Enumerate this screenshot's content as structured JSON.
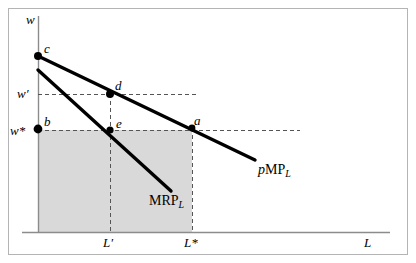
{
  "figure": {
    "type": "economics-diagram",
    "frame": {
      "border_color": "#b4b4b4",
      "background": "#ffffff"
    },
    "axes": {
      "y_axis_label": "w",
      "x_axis_label": "L",
      "axis_color": "#8c8c8c",
      "origin_x": 38,
      "origin_y": 232,
      "x_axis_end": 390,
      "y_axis_top": 16
    },
    "shaded_region": {
      "fill": "#d9d9d9",
      "name": "wage-bill-rectangle",
      "x": 38,
      "y": 130,
      "width": 154,
      "height": 102
    },
    "curves": [
      {
        "name": "pMPL",
        "label_lead": "p",
        "label_main": "MP",
        "label_sub": "L",
        "color": "#000000",
        "stroke_width": 3.4,
        "from": {
          "x": 38,
          "y": 56
        },
        "to": {
          "x": 255,
          "y": 160
        },
        "label_x": 258,
        "label_y": 163
      },
      {
        "name": "MRPL",
        "label_lead": "",
        "label_main": "MRP",
        "label_sub": "L",
        "color": "#000000",
        "stroke_width": 3.4,
        "from": {
          "x": 38,
          "y": 70
        },
        "to": {
          "x": 171,
          "y": 191
        },
        "label_x": 149,
        "label_y": 194
      }
    ],
    "points": [
      {
        "id": "c",
        "label": "c",
        "x": 38,
        "y": 56,
        "label_x": 44,
        "label_y": 42,
        "dot": true
      },
      {
        "id": "d",
        "label": "d",
        "x": 110,
        "y": 94,
        "label_x": 115,
        "label_y": 79,
        "dot": true
      },
      {
        "id": "b",
        "label": "b",
        "x": 38,
        "y": 129,
        "label_x": 44,
        "label_y": 115,
        "dot": true
      },
      {
        "id": "e",
        "label": "e",
        "x": 110,
        "y": 130,
        "label_x": 116,
        "label_y": 117,
        "dot": true
      },
      {
        "id": "a",
        "label": "a",
        "x": 192,
        "y": 128,
        "label_x": 194,
        "label_y": 114,
        "dot": true
      }
    ],
    "tick_labels": [
      {
        "id": "w-prime",
        "text": "w′",
        "x": 17,
        "y": 87,
        "axis": "y"
      },
      {
        "id": "w-star",
        "text": "w*",
        "x": 10,
        "y": 124,
        "axis": "y"
      },
      {
        "id": "L-prime",
        "text": "L′",
        "x": 103,
        "y": 236,
        "axis": "x"
      },
      {
        "id": "L-star",
        "text": "L*",
        "x": 184,
        "y": 236,
        "axis": "x"
      }
    ],
    "guide_lines": [
      {
        "name": "w-prime-horizontal",
        "x1": 38,
        "y1": 94,
        "x2": 196,
        "y2": 94,
        "style": "dashed"
      },
      {
        "name": "w-star-horizontal",
        "x1": 38,
        "y1": 130,
        "x2": 300,
        "y2": 130,
        "style": "dashed"
      },
      {
        "name": "L-prime-vertical",
        "x1": 110,
        "y1": 94,
        "x2": 110,
        "y2": 232,
        "style": "dashed"
      },
      {
        "name": "L-star-vertical",
        "x1": 192,
        "y1": 128,
        "x2": 192,
        "y2": 232,
        "style": "dashed"
      }
    ],
    "axis_labels": {
      "y": {
        "text": "w",
        "x": 26,
        "y": 13
      },
      "x": {
        "text": "L",
        "x": 364,
        "y": 236
      }
    }
  }
}
